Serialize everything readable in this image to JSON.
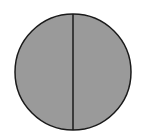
{
  "diagram": {
    "shape": "circle",
    "divisions": 2,
    "shaded_parts": 2,
    "colors": {
      "fill": "#9a9a9a",
      "stroke": "#1a1a1a",
      "background": "#ffffff"
    }
  }
}
